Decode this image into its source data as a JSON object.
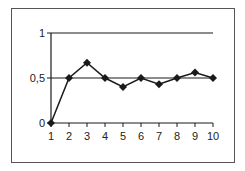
{
  "chart_data": {
    "type": "line",
    "title": "",
    "xlabel": "",
    "ylabel": "",
    "x": [
      1,
      2,
      3,
      4,
      5,
      6,
      7,
      8,
      9,
      10
    ],
    "categories": [
      "1",
      "2",
      "3",
      "4",
      "5",
      "6",
      "7",
      "8",
      "9",
      "10"
    ],
    "series": [
      {
        "name": "",
        "marker": "diamond",
        "values": [
          0,
          0.5,
          0.67,
          0.5,
          0.4,
          0.5,
          0.43,
          0.5,
          0.56,
          0.5
        ]
      }
    ],
    "ylim": [
      0,
      1
    ],
    "xlim": [
      1,
      10
    ],
    "yticks": [
      0,
      0.5,
      1
    ],
    "ytick_labels": [
      "0",
      "0,5",
      "1"
    ],
    "xtick_labels": [
      "1",
      "2",
      "3",
      "4",
      "5",
      "6",
      "7",
      "8",
      "9",
      "10"
    ],
    "gridlines": [
      0.5,
      1
    ],
    "grid": true,
    "legend": null,
    "colors": {
      "line": "#1a1a1a",
      "grid": "#1a1a1a",
      "frame": "#555555",
      "background": "#ffffff"
    }
  }
}
